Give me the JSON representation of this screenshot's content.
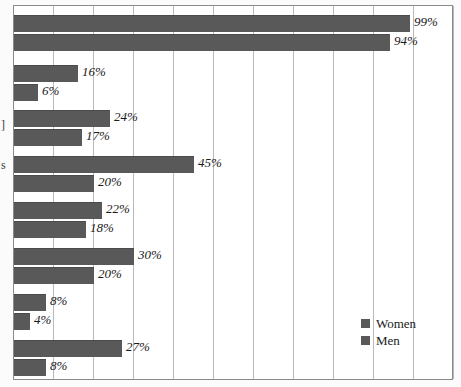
{
  "chart_data": {
    "type": "bar",
    "orientation": "horizontal",
    "title": "",
    "xlabel": "",
    "ylabel": "",
    "xlim": [
      0,
      110
    ],
    "gridline_step": 10,
    "grid": true,
    "value_suffix": "%",
    "legend_position": "bottom-right",
    "categories": [
      "",
      "",
      "",
      "",
      "",
      "",
      ""
    ],
    "series": [
      {
        "name": "Women",
        "color": "#595959",
        "values": [
          99,
          16,
          24,
          45,
          22,
          30,
          8
        ],
        "labels": [
          "99%",
          "16%",
          "24%",
          "45%",
          "22%",
          "30%",
          "8%"
        ]
      },
      {
        "name": "Men",
        "color": "#595959",
        "values": [
          94,
          6,
          17,
          20,
          18,
          20,
          4
        ],
        "labels": [
          "94%",
          "6%",
          "17%",
          "20%",
          "18%",
          "20%",
          "4%"
        ]
      }
    ],
    "extra_group": {
      "note": "eighth pair at bottom",
      "women": 27,
      "men": 8,
      "women_label": "27%",
      "men_label": "8%"
    }
  },
  "legend": {
    "items": [
      {
        "label": "Women",
        "color": "#595959"
      },
      {
        "label": "Men",
        "color": "#595959"
      }
    ]
  },
  "axis": {
    "gridlines": [
      0,
      10,
      20,
      30,
      40,
      50,
      60,
      70,
      80,
      90,
      100,
      110
    ],
    "tick_labels": []
  },
  "category_fragments": [
    {
      "text": "]",
      "top": 118
    },
    {
      "text": "s",
      "top": 158
    }
  ],
  "bars": [
    {
      "series": "Women",
      "value": 99,
      "label": "99%",
      "top": 14
    },
    {
      "series": "Men",
      "value": 94,
      "label": "94%",
      "top": 33
    },
    {
      "series": "Women",
      "value": 16,
      "label": "16%",
      "top": 64
    },
    {
      "series": "Men",
      "value": 6,
      "label": "6%",
      "top": 83
    },
    {
      "series": "Women",
      "value": 24,
      "label": "24%",
      "top": 109
    },
    {
      "series": "Men",
      "value": 17,
      "label": "17%",
      "top": 128
    },
    {
      "series": "Women",
      "value": 45,
      "label": "45%",
      "top": 155
    },
    {
      "series": "Men",
      "value": 20,
      "label": "20%",
      "top": 174
    },
    {
      "series": "Women",
      "value": 22,
      "label": "22%",
      "top": 201
    },
    {
      "series": "Men",
      "value": 18,
      "label": "18%",
      "top": 220
    },
    {
      "series": "Women",
      "value": 30,
      "label": "30%",
      "top": 247
    },
    {
      "series": "Men",
      "value": 20,
      "label": "20%",
      "top": 266
    },
    {
      "series": "Women",
      "value": 8,
      "label": "8%",
      "top": 293
    },
    {
      "series": "Men",
      "value": 4,
      "label": "4%",
      "top": 312
    },
    {
      "series": "Women",
      "value": 27,
      "label": "27%",
      "top": 339
    },
    {
      "series": "Men",
      "value": 8,
      "label": "8%",
      "top": 358
    }
  ]
}
